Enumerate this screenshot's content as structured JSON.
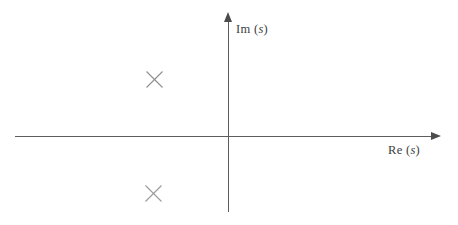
{
  "figure": {
    "background_color": "#ffffff",
    "width": 458,
    "height": 225
  },
  "axes": {
    "real": {
      "label_prefix": "Re (",
      "label_var": "s",
      "label_suffix": ")",
      "label_full": "Re (s)",
      "color": "#5d5d5d",
      "arrow": "right-arrowhead",
      "origin_px": 228,
      "start_px": 15,
      "end_px": 441
    },
    "imaginary": {
      "label_prefix": "Im (",
      "label_var": "s",
      "label_suffix": ")",
      "label_full": "Im (s)",
      "color": "#5d5d5d",
      "arrow": "up-arrowhead",
      "origin_px": 137,
      "start_px": 12,
      "end_px": 212
    }
  },
  "chart_data": {
    "type": "scatter",
    "title": "",
    "xlabel": "Re (s)",
    "ylabel": "Im (s)",
    "grid": false,
    "legend": "none",
    "marker": "x",
    "marker_color": "#8a8a8a",
    "series": [
      {
        "name": "poles",
        "symbol": "x",
        "points": [
          {
            "label": "upper-pole",
            "re": -0.74,
            "im": 0.58,
            "px": 154,
            "py": 79
          },
          {
            "label": "lower-pole",
            "re": -0.75,
            "im": -0.56,
            "px": 153,
            "py": 193
          }
        ]
      }
    ],
    "annotations": []
  },
  "markers": [
    {
      "name": "pole-marker-upper",
      "x": 145,
      "y": 70,
      "size": 19,
      "color": "#8f8f8f"
    },
    {
      "name": "pole-marker-lower",
      "x": 144,
      "y": 184,
      "size": 19,
      "color": "#999999"
    }
  ]
}
